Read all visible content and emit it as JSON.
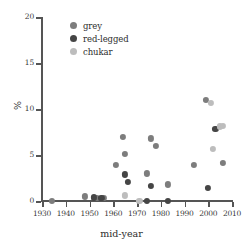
{
  "chart_data": {
    "type": "scatter",
    "title": "",
    "xlabel": "mid-year",
    "ylabel": "%",
    "xlim": [
      1930,
      2010
    ],
    "ylim": [
      0,
      20
    ],
    "grid": false,
    "legend_position": "top-left",
    "xticks": [
      1930,
      1940,
      1950,
      1960,
      1970,
      1980,
      1990,
      2000,
      2010
    ],
    "yticks": [
      0,
      5,
      10,
      15,
      20
    ],
    "colors": {
      "grey": "#7d7d7d",
      "red-legged": "#454545",
      "chukar": "#bdbdbd"
    },
    "series": [
      {
        "name": "grey",
        "color": "#7d7d7d",
        "points": [
          {
            "x": 1934,
            "y": 0.0
          },
          {
            "x": 1948,
            "y": 0.5
          },
          {
            "x": 1953,
            "y": 0.3
          },
          {
            "x": 1956,
            "y": 0.3
          },
          {
            "x": 1961,
            "y": 3.9
          },
          {
            "x": 1964,
            "y": 7.0
          },
          {
            "x": 1965,
            "y": 5.1
          },
          {
            "x": 1974,
            "y": 3.0
          },
          {
            "x": 1976,
            "y": 6.8
          },
          {
            "x": 1978,
            "y": 6.0
          },
          {
            "x": 1983,
            "y": 1.8
          },
          {
            "x": 1994,
            "y": 3.9
          },
          {
            "x": 1999,
            "y": 11.0
          },
          {
            "x": 2006,
            "y": 4.1
          }
        ]
      },
      {
        "name": "red-legged",
        "color": "#454545",
        "points": [
          {
            "x": 1952,
            "y": 0.4
          },
          {
            "x": 1955,
            "y": 0.3
          },
          {
            "x": 1965,
            "y": 2.9
          },
          {
            "x": 1966,
            "y": 2.1
          },
          {
            "x": 1974,
            "y": 0.0
          },
          {
            "x": 1976,
            "y": 1.6
          },
          {
            "x": 1983,
            "y": 0.0
          },
          {
            "x": 2000,
            "y": 1.4
          },
          {
            "x": 2003,
            "y": 7.8
          }
        ]
      },
      {
        "name": "chukar",
        "color": "#bdbdbd",
        "points": [
          {
            "x": 1965,
            "y": 0.6
          },
          {
            "x": 1971,
            "y": 0.0
          },
          {
            "x": 2001,
            "y": 10.7
          },
          {
            "x": 2002,
            "y": 5.7
          },
          {
            "x": 2005,
            "y": 8.1
          },
          {
            "x": 2006,
            "y": 8.2
          }
        ]
      }
    ]
  },
  "axes": {
    "xlabel": "mid-year",
    "ylabel": "%",
    "xticks": [
      "1930",
      "1940",
      "1950",
      "1960",
      "1970",
      "1980",
      "1990",
      "2000",
      "2010"
    ],
    "yticks": [
      "0",
      "5",
      "10",
      "15",
      "20"
    ]
  },
  "legend": {
    "items": [
      {
        "label": "grey",
        "color": "#7d7d7d"
      },
      {
        "label": "red-legged",
        "color": "#454545"
      },
      {
        "label": "chukar",
        "color": "#bdbdbd"
      }
    ]
  }
}
